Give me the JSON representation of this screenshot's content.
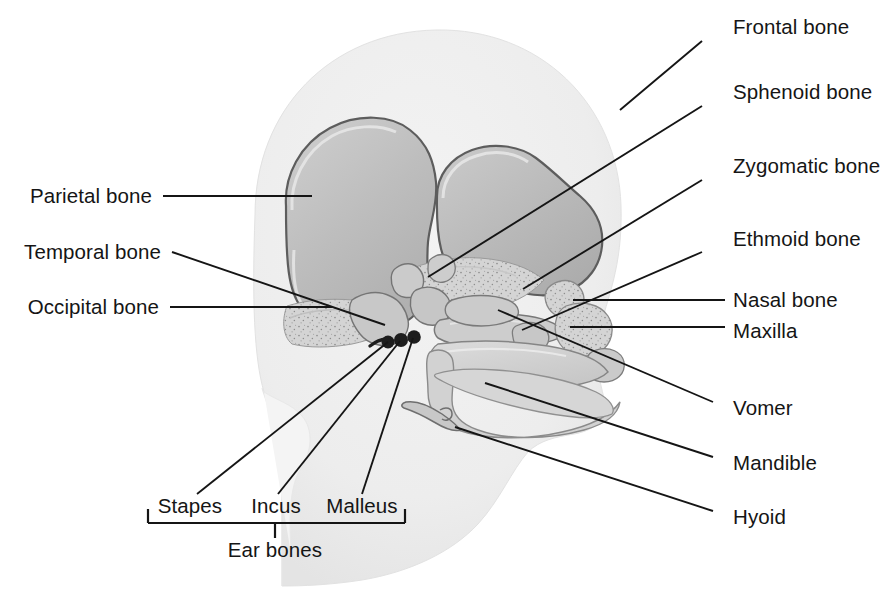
{
  "figure": {
    "background_color": "#ffffff",
    "ink_color": "#151515",
    "palette": {
      "head_silhouette": "#ececec",
      "head_silhouette_edge": "#e0e0e0",
      "bone_light": "#d8d8d8",
      "bone_mid": "#c2c2c2",
      "bone_dark": "#a9a9a9",
      "bone_outline": "#5a5a5a",
      "ear_bone": "#1d1d1d"
    }
  },
  "labels": {
    "right": [
      {
        "id": "frontal",
        "text": "Frontal bone",
        "text_x": 733,
        "text_y": 27,
        "line": [
          702,
          41,
          620,
          110
        ]
      },
      {
        "id": "sphenoid",
        "text": "Sphenoid bone",
        "text_x": 733,
        "text_y": 92,
        "line": [
          702,
          106,
          428,
          277
        ]
      },
      {
        "id": "zygomatic",
        "text": "Zygomatic bone",
        "text_x": 733,
        "text_y": 166,
        "line": [
          702,
          180,
          523,
          289
        ]
      },
      {
        "id": "ethmoid",
        "text": "Ethmoid bone",
        "text_x": 733,
        "text_y": 239,
        "line": [
          702,
          252,
          522,
          330
        ]
      },
      {
        "id": "nasal",
        "text": "Nasal bone",
        "text_x": 733,
        "text_y": 300,
        "line": [
          725,
          300,
          573,
          300
        ]
      },
      {
        "id": "maxilla",
        "text": "Maxilla",
        "text_x": 733,
        "text_y": 331,
        "line": [
          725,
          327,
          570,
          327
        ]
      },
      {
        "id": "vomer",
        "text": "Vomer",
        "text_x": 733,
        "text_y": 408,
        "line": [
          713,
          402,
          498,
          310
        ]
      },
      {
        "id": "mandible",
        "text": "Mandible",
        "text_x": 733,
        "text_y": 463,
        "line": [
          713,
          457,
          485,
          383
        ]
      },
      {
        "id": "hyoid",
        "text": "Hyoid",
        "text_x": 733,
        "text_y": 517,
        "line": [
          713,
          511,
          455,
          427
        ]
      }
    ],
    "left": [
      {
        "id": "parietal",
        "text": "Parietal bone",
        "text_x": 150,
        "text_y": 196,
        "line": [
          163,
          196,
          312,
          196
        ]
      },
      {
        "id": "temporal",
        "text": "Temporal bone",
        "text_x": 159,
        "text_y": 256,
        "line": [
          172,
          252,
          385,
          325
        ]
      },
      {
        "id": "occipital",
        "text": "Occipital bone",
        "text_x": 157,
        "text_y": 310,
        "line": [
          170,
          307,
          332,
          307
        ]
      }
    ],
    "ear": {
      "group_label": "Ear bones",
      "group_label_x": 275,
      "group_label_y": 552,
      "bracket": {
        "left_x": 148,
        "right_x": 405,
        "y": 523,
        "tick_height": 14,
        "stem_x": 275,
        "stem_bottom": 538
      },
      "items": [
        {
          "id": "stapes",
          "text": "Stapes",
          "text_x": 185,
          "text_y": 509,
          "line": [
            197,
            494,
            388,
            342
          ]
        },
        {
          "id": "incus",
          "text": "Incus",
          "text_x": 275,
          "text_y": 509,
          "line": [
            278,
            494,
            400,
            341
          ]
        },
        {
          "id": "malleus",
          "text": "Malleus",
          "text_x": 358,
          "text_y": 509,
          "line": [
            362,
            494,
            413,
            338
          ]
        }
      ]
    }
  }
}
